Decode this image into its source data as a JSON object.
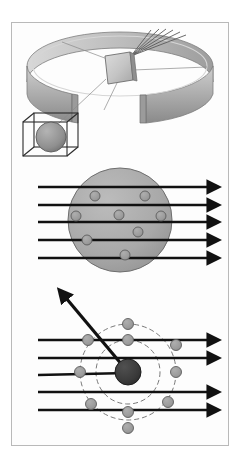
{
  "figure": {
    "panel_count": 3,
    "background_color": "#ffffff",
    "border_color": "#b9b9b9",
    "canvas": {
      "width": 241,
      "height": 456
    },
    "content_box": {
      "x": 11,
      "y": 22,
      "width": 218,
      "height": 424
    }
  },
  "panels": [
    {
      "id": "apparatus",
      "name": "scattering-apparatus-panel",
      "description": "Circular detector screen ring with gold foil target at center and scattered ray fan",
      "bounds": {
        "x": 14,
        "y": 24,
        "width": 212,
        "height": 140
      }
    },
    {
      "id": "thomson-model",
      "name": "thomson-plum-pudding-panel",
      "description": "Uniform positive sphere with embedded electrons; all alpha rays pass straight through",
      "bounds": {
        "x": 14,
        "y": 166,
        "width": 212,
        "height": 110
      }
    },
    {
      "id": "rutherford-model",
      "name": "rutherford-nuclear-panel",
      "description": "Dense central nucleus with dashed electron orbits; one alpha ray backscatters",
      "bounds": {
        "x": 14,
        "y": 286,
        "width": 212,
        "height": 158
      }
    }
  ],
  "colors": {
    "ray_stroke": "#111111",
    "sphere_fill": "#a9a9a9",
    "sphere_stroke": "#6e6e6e",
    "electron_fill": "#9a9a9a",
    "electron_stroke": "#5e5e5e",
    "nucleus_fill": "#3a3a3a",
    "nucleus_stroke": "#1d1d1d",
    "orbit_stroke": "#6a6a6a",
    "ring_light": "#e2e2e2",
    "ring_mid": "#b5b5b5",
    "ring_dark": "#8d8d8d",
    "foil_fill": "#c9c9c9",
    "leader_stroke": "#8a8a8a",
    "cube_stroke": "#2b2b2b"
  },
  "apparatus": {
    "detector_ring": {
      "name": "detector-screen-ring",
      "center": {
        "x": 120,
        "y": 66
      },
      "radius_x": 93,
      "radius_y": 34,
      "band_height": 30,
      "gap_degrees": 46,
      "label": "zinc sulfide detector screen"
    },
    "foil": {
      "name": "gold-foil-target",
      "x": 105,
      "y": 54,
      "width": 27,
      "height": 28,
      "label": "gold foil"
    },
    "scattered_rays": {
      "name": "scattered-ray-fan",
      "origin": {
        "x": 131,
        "y": 55
      },
      "count": 6,
      "endpoints": [
        {
          "x": 151,
          "y": 30
        },
        {
          "x": 159,
          "y": 29
        },
        {
          "x": 166,
          "y": 29
        },
        {
          "x": 173,
          "y": 30
        },
        {
          "x": 180,
          "y": 32
        },
        {
          "x": 186,
          "y": 35
        }
      ]
    },
    "leader_lines": {
      "name": "leader-lines",
      "count": 4,
      "segments": [
        {
          "x1": 110,
          "y1": 60,
          "x2": 62,
          "y2": 42
        },
        {
          "x1": 132,
          "y1": 70,
          "x2": 207,
          "y2": 66
        },
        {
          "x1": 116,
          "y1": 82,
          "x2": 104,
          "y2": 110
        },
        {
          "x1": 106,
          "y1": 78,
          "x2": 57,
          "y2": 124
        }
      ]
    },
    "atom_inset": {
      "name": "atom-magnification-inset",
      "cube": {
        "x": 23,
        "y": 114,
        "width": 56,
        "height": 42,
        "depth": 14
      },
      "sphere": {
        "cx": 51,
        "cy": 137,
        "r": 15
      },
      "label": "magnified atom"
    }
  },
  "thomson": {
    "sphere": {
      "name": "positive-charge-sphere",
      "cx": 120,
      "cy": 220,
      "r": 52
    },
    "electrons": {
      "name": "embedded-electrons",
      "count": 8,
      "radius": 5,
      "positions": [
        {
          "x": 95,
          "y": 196
        },
        {
          "x": 145,
          "y": 196
        },
        {
          "x": 76,
          "y": 216
        },
        {
          "x": 119,
          "y": 215
        },
        {
          "x": 161,
          "y": 216
        },
        {
          "x": 87,
          "y": 240
        },
        {
          "x": 138,
          "y": 232
        },
        {
          "x": 125,
          "y": 255
        }
      ]
    },
    "rays": {
      "name": "alpha-particle-rays",
      "count": 5,
      "x_start": 38,
      "x_end": 215,
      "y_values": [
        187,
        205,
        222,
        240,
        258
      ],
      "stroke_width": 2.6,
      "description": "all rays pass undeflected"
    }
  },
  "rutherford": {
    "nucleus": {
      "name": "atomic-nucleus",
      "cx": 128,
      "cy": 372,
      "r": 13
    },
    "orbits": {
      "name": "electron-orbits",
      "count": 2,
      "dashed": true,
      "inner_radius": 32,
      "outer_radius": 48,
      "center": {
        "x": 128,
        "y": 372
      }
    },
    "electrons": {
      "name": "orbiting-electrons",
      "count": 10,
      "radius": 5.5,
      "positions": [
        {
          "x": 128,
          "y": 324
        },
        {
          "x": 128,
          "y": 340
        },
        {
          "x": 88,
          "y": 340
        },
        {
          "x": 176,
          "y": 345
        },
        {
          "x": 80,
          "y": 372
        },
        {
          "x": 176,
          "y": 372
        },
        {
          "x": 91,
          "y": 404
        },
        {
          "x": 168,
          "y": 402
        },
        {
          "x": 128,
          "y": 412
        },
        {
          "x": 128,
          "y": 428
        }
      ]
    },
    "rays": {
      "name": "alpha-particle-rays",
      "count": 5,
      "x_start": 38,
      "x_end": 215,
      "y_values": [
        340,
        358,
        375,
        392,
        410
      ],
      "stroke_width": 2.6,
      "deflected_index": 2,
      "description": "four rays pass through; one strikes the nucleus and backscatters"
    },
    "deflected_ray": {
      "name": "backscattered-alpha-ray",
      "from": {
        "x": 128,
        "y": 372
      },
      "to": {
        "x": 64,
        "y": 296
      },
      "stroke_width": 3.2,
      "arrow": true
    }
  }
}
